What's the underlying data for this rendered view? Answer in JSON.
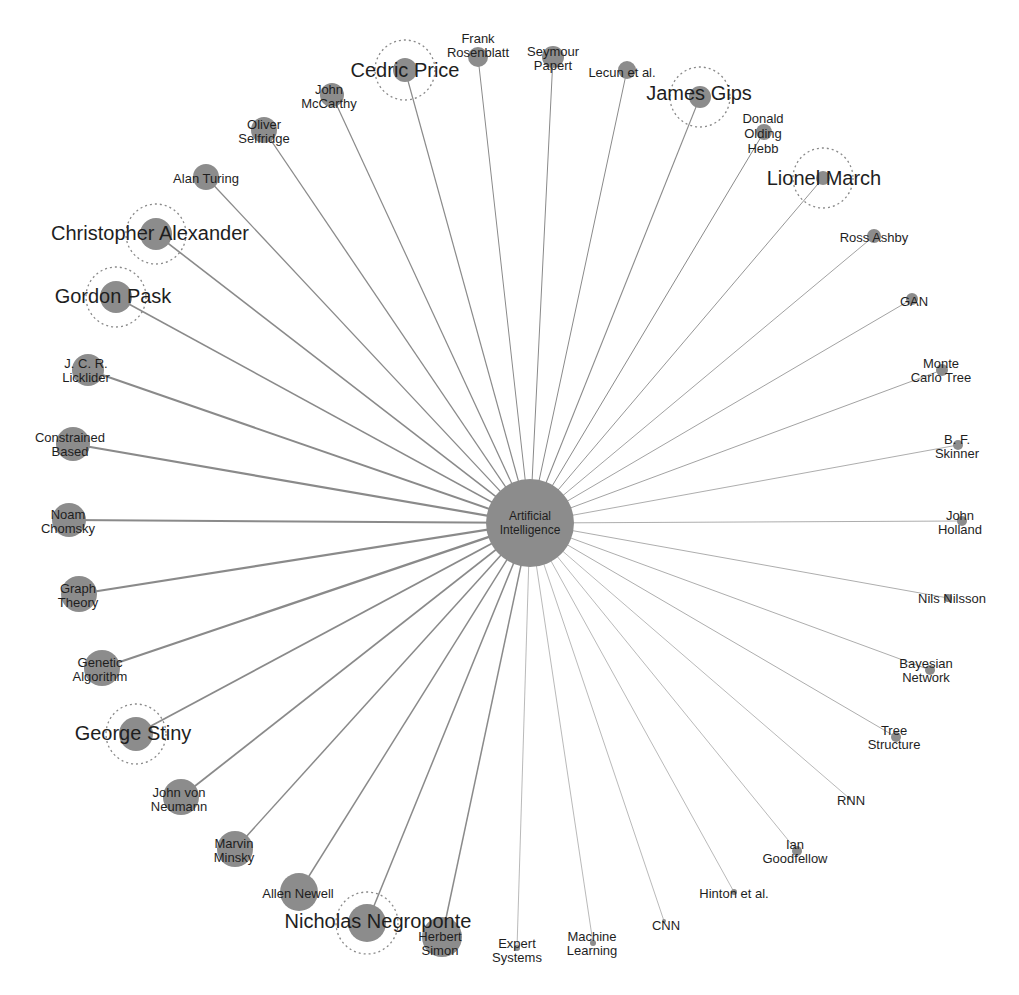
{
  "figure": {
    "type": "radial-network",
    "background": "#ffffff",
    "colors": {
      "node": "#8c8c8c",
      "edge": "#8a8a8a",
      "label": "#1e1e1e",
      "halo": "#8a8a8a"
    },
    "center": {
      "id": "ai",
      "label_lines": [
        "Artificial",
        "Intelligence"
      ],
      "x": 530,
      "y": 523,
      "r": 44,
      "font": 12
    },
    "nodes": [
      {
        "id": "frank-rosenblatt",
        "label_lines": [
          "Frank",
          "Rosenblatt"
        ],
        "x": 478,
        "y": 57,
        "r": 10,
        "font": 13,
        "lx": 478,
        "ly": 45,
        "w": 1.0
      },
      {
        "id": "seymour-papert",
        "label_lines": [
          "Seymour",
          "Papert"
        ],
        "x": 553,
        "y": 57,
        "r": 11,
        "font": 13,
        "lx": 553,
        "ly": 58,
        "w": 1.0
      },
      {
        "id": "lecun-et-al",
        "label_lines": [
          "Lecun et al."
        ],
        "x": 627,
        "y": 70,
        "r": 9,
        "font": 13,
        "lx": 622,
        "ly": 72,
        "w": 1.0
      },
      {
        "id": "cedric-price",
        "label_lines": [
          "Cedric Price"
        ],
        "x": 405,
        "y": 70,
        "r": 12,
        "font": 20,
        "lx": 405,
        "ly": 70,
        "w": 1.2,
        "halo": 30
      },
      {
        "id": "james-gips",
        "label_lines": [
          "James Gips"
        ],
        "x": 700,
        "y": 97,
        "r": 11,
        "font": 20,
        "lx": 699,
        "ly": 93,
        "w": 1.1,
        "halo": 30
      },
      {
        "id": "john-mccarthy",
        "label_lines": [
          "John",
          "McCarthy"
        ],
        "x": 332,
        "y": 95,
        "r": 12,
        "font": 13,
        "lx": 329,
        "ly": 96,
        "w": 1.2
      },
      {
        "id": "donald-olding-hebb",
        "label_lines": [
          "Donald",
          "Olding",
          "Hebb"
        ],
        "x": 764,
        "y": 132,
        "r": 8,
        "font": 13,
        "lx": 763,
        "ly": 133,
        "w": 1.0
      },
      {
        "id": "oliver-selfridge",
        "label_lines": [
          "Oliver",
          "Selfridge"
        ],
        "x": 264,
        "y": 130,
        "r": 13,
        "font": 13,
        "lx": 264,
        "ly": 131,
        "w": 1.3
      },
      {
        "id": "lionel-march",
        "label_lines": [
          "Lionel March"
        ],
        "x": 823,
        "y": 178,
        "r": 7,
        "font": 20,
        "lx": 824,
        "ly": 178,
        "w": 0.9,
        "halo": 30
      },
      {
        "id": "alan-turing",
        "label_lines": [
          "Alan Turing"
        ],
        "x": 206,
        "y": 177,
        "r": 13,
        "font": 13,
        "lx": 206,
        "ly": 178,
        "w": 1.3
      },
      {
        "id": "christopher-alexander",
        "label_lines": [
          "Christopher Alexander"
        ],
        "x": 156,
        "y": 234,
        "r": 16,
        "font": 20,
        "lx": 150,
        "ly": 233,
        "w": 1.6,
        "halo": 30
      },
      {
        "id": "ross-ashby",
        "label_lines": [
          "Ross Ashby"
        ],
        "x": 874,
        "y": 236,
        "r": 7,
        "font": 13,
        "lx": 874,
        "ly": 237,
        "w": 0.8
      },
      {
        "id": "gordon-pask",
        "label_lines": [
          "Gordon Pask"
        ],
        "x": 116,
        "y": 297,
        "r": 16,
        "font": 20,
        "lx": 113,
        "ly": 296,
        "w": 1.6,
        "halo": 30
      },
      {
        "id": "gan",
        "label_lines": [
          "GAN"
        ],
        "x": 912,
        "y": 299,
        "r": 6,
        "font": 13,
        "lx": 914,
        "ly": 301,
        "w": 0.8
      },
      {
        "id": "jcr-licklider",
        "label_lines": [
          "J. C. R.",
          "Licklider"
        ],
        "x": 88,
        "y": 370,
        "r": 16,
        "font": 13,
        "lx": 86,
        "ly": 370,
        "w": 2.0
      },
      {
        "id": "monte-carlo-tree",
        "label_lines": [
          "Monte",
          "Carlo Tree"
        ],
        "x": 942,
        "y": 370,
        "r": 6,
        "font": 13,
        "lx": 941,
        "ly": 370,
        "w": 0.8
      },
      {
        "id": "constrained-based",
        "label_lines": [
          "Constrained",
          "Based"
        ],
        "x": 73,
        "y": 444,
        "r": 17,
        "font": 13,
        "lx": 70,
        "ly": 444,
        "w": 2.2
      },
      {
        "id": "bf-skinner",
        "label_lines": [
          "B. F.",
          "Skinner"
        ],
        "x": 958,
        "y": 445,
        "r": 5,
        "font": 13,
        "lx": 957,
        "ly": 446,
        "w": 0.7
      },
      {
        "id": "noam-chomsky",
        "label_lines": [
          "Noam",
          "Chomsky"
        ],
        "x": 69,
        "y": 520,
        "r": 17,
        "font": 13,
        "lx": 68,
        "ly": 521,
        "w": 2.0
      },
      {
        "id": "john-holland",
        "label_lines": [
          "John",
          "Holland"
        ],
        "x": 962,
        "y": 521,
        "r": 5,
        "font": 13,
        "lx": 960,
        "ly": 522,
        "w": 0.7
      },
      {
        "id": "graph-theory",
        "label_lines": [
          "Graph",
          "Theory"
        ],
        "x": 79,
        "y": 594,
        "r": 18,
        "font": 13,
        "lx": 78,
        "ly": 595,
        "w": 2.2
      },
      {
        "id": "nils-nilsson",
        "label_lines": [
          "Nils Nilsson"
        ],
        "x": 948,
        "y": 598,
        "r": 4,
        "font": 13,
        "lx": 952,
        "ly": 598,
        "w": 0.7
      },
      {
        "id": "genetic-algorithm",
        "label_lines": [
          "Genetic",
          "Algorithm"
        ],
        "x": 102,
        "y": 668,
        "r": 18,
        "font": 13,
        "lx": 100,
        "ly": 669,
        "w": 2.2
      },
      {
        "id": "bayesian-network",
        "label_lines": [
          "Bayesian",
          "Network"
        ],
        "x": 930,
        "y": 670,
        "r": 5,
        "font": 13,
        "lx": 926,
        "ly": 670,
        "w": 0.7
      },
      {
        "id": "george-stiny",
        "label_lines": [
          "George Stiny"
        ],
        "x": 136,
        "y": 734,
        "r": 17,
        "font": 20,
        "lx": 133,
        "ly": 733,
        "w": 1.8,
        "halo": 30
      },
      {
        "id": "tree-structure",
        "label_lines": [
          "Tree",
          "Structure"
        ],
        "x": 896,
        "y": 737,
        "r": 5,
        "font": 13,
        "lx": 894,
        "ly": 737,
        "w": 0.7
      },
      {
        "id": "john-von-neumann",
        "label_lines": [
          "John von",
          "Neumann"
        ],
        "x": 181,
        "y": 797,
        "r": 18,
        "font": 13,
        "lx": 179,
        "ly": 799,
        "w": 1.8
      },
      {
        "id": "rnn",
        "label_lines": [
          "RNN"
        ],
        "x": 849,
        "y": 798,
        "r": 2,
        "font": 13,
        "lx": 851,
        "ly": 800,
        "w": 0.6
      },
      {
        "id": "marvin-minsky",
        "label_lines": [
          "Marvin",
          "Minsky"
        ],
        "x": 235,
        "y": 849,
        "r": 18,
        "font": 13,
        "lx": 234,
        "ly": 850,
        "w": 1.5
      },
      {
        "id": "ian-goodfellow",
        "label_lines": [
          "Ian",
          "Goodfellow"
        ],
        "x": 797,
        "y": 851,
        "r": 5,
        "font": 13,
        "lx": 795,
        "ly": 851,
        "w": 0.6
      },
      {
        "id": "allen-newell",
        "label_lines": [
          "Allen Newell"
        ],
        "x": 299,
        "y": 892,
        "r": 19,
        "font": 13,
        "lx": 298,
        "ly": 893,
        "w": 1.5
      },
      {
        "id": "hinton-et-al",
        "label_lines": [
          "Hinton et al."
        ],
        "x": 734,
        "y": 892,
        "r": 3,
        "font": 13,
        "lx": 734,
        "ly": 893,
        "w": 0.6
      },
      {
        "id": "nicholas-negroponte",
        "label_lines": [
          "Nicholas Negroponte"
        ],
        "x": 367,
        "y": 923,
        "r": 19,
        "font": 20,
        "lx": 378,
        "ly": 921,
        "w": 1.5,
        "halo": 31
      },
      {
        "id": "cnn",
        "label_lines": [
          "CNN"
        ],
        "x": 664,
        "y": 921,
        "r": 2,
        "font": 13,
        "lx": 666,
        "ly": 925,
        "w": 0.6
      },
      {
        "id": "herbert-simon",
        "label_lines": [
          "Herbert",
          "Simon"
        ],
        "x": 442,
        "y": 937,
        "r": 20,
        "font": 13,
        "lx": 440,
        "ly": 943,
        "w": 1.5
      },
      {
        "id": "expert-systems",
        "label_lines": [
          "Expert",
          "Systems"
        ],
        "x": 517,
        "y": 948,
        "r": 3,
        "font": 13,
        "lx": 517,
        "ly": 950,
        "w": 0.6
      },
      {
        "id": "machine-learning",
        "label_lines": [
          "Machine",
          "Learning"
        ],
        "x": 593,
        "y": 943,
        "r": 3,
        "font": 13,
        "lx": 592,
        "ly": 943,
        "w": 0.6
      }
    ]
  }
}
